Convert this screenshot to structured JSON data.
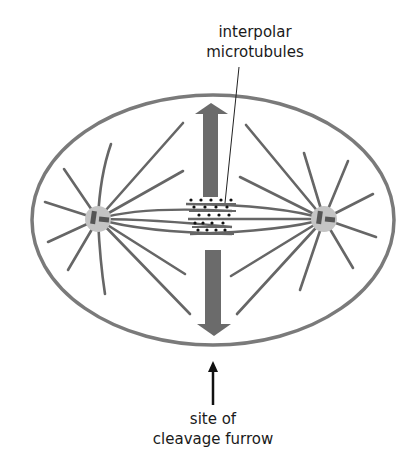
{
  "labels": {
    "interpolar": {
      "line1": "interpolar",
      "line2": "microtubules"
    },
    "furrow": {
      "line1": "site of",
      "line2": "cleavage furrow"
    }
  },
  "colors": {
    "cell_membrane": "#7a7a7a",
    "microtubule": "#666666",
    "force_arrow": "#6b6b6b",
    "centrosome": "#c4c4c4",
    "centriole": "#555555",
    "motor_dot": "#111111",
    "leader_line": "#222222",
    "pointer_arrow": "#111111",
    "text": "#1a1a1a"
  },
  "cell": {
    "cx": 213,
    "cy": 220,
    "rx": 182,
    "ry": 126
  },
  "centrosomes": [
    {
      "name": "left",
      "cx": 98,
      "cy": 219,
      "r": 13
    },
    {
      "name": "right",
      "cx": 324,
      "cy": 219,
      "r": 13
    }
  ],
  "astral_rays": {
    "left": [
      [
        111,
        144
      ],
      [
        64,
        169
      ],
      [
        45,
        202
      ],
      [
        48,
        242
      ],
      [
        68,
        270
      ],
      [
        105,
        294
      ],
      [
        183,
        123
      ],
      [
        183,
        171
      ],
      [
        185,
        274
      ],
      [
        190,
        314
      ]
    ],
    "right": [
      [
        246,
        125
      ],
      [
        240,
        177
      ],
      [
        304,
        153
      ],
      [
        348,
        161
      ],
      [
        373,
        194
      ],
      [
        376,
        237
      ],
      [
        353,
        268
      ],
      [
        300,
        290
      ],
      [
        231,
        276
      ],
      [
        237,
        314
      ]
    ]
  },
  "overlap_zone": {
    "rows_y": [
      204,
      211,
      219,
      227,
      234
    ],
    "dots_per_row": 5
  }
}
